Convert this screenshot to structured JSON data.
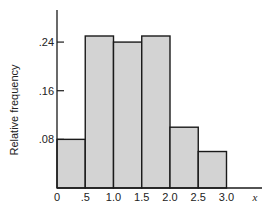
{
  "chart_data": {
    "type": "bar",
    "subtype": "histogram",
    "title": "",
    "xlabel": "x",
    "ylabel": "Relative frequency",
    "bins": [
      [
        0.0,
        0.5
      ],
      [
        0.5,
        1.0
      ],
      [
        1.0,
        1.5
      ],
      [
        1.5,
        2.0
      ],
      [
        2.0,
        2.5
      ],
      [
        2.5,
        3.0
      ]
    ],
    "categories": [
      "0-0.5",
      "0.5-1.0",
      "1.0-1.5",
      "1.5-2.0",
      "2.0-2.5",
      "2.5-3.0"
    ],
    "values": [
      0.08,
      0.25,
      0.24,
      0.25,
      0.1,
      0.06
    ],
    "xticks": [
      0,
      0.5,
      1.0,
      1.5,
      2.0,
      2.5,
      3.0
    ],
    "xtick_labels": [
      "0",
      ".5",
      "1.0",
      "1.5",
      "2.0",
      "2.5",
      "3.0"
    ],
    "yticks": [
      0.08,
      0.16,
      0.24
    ],
    "ytick_labels": [
      ".08",
      ".16",
      ".24"
    ],
    "xlim": [
      0,
      3.6
    ],
    "ylim": [
      0,
      0.29
    ],
    "grid": false,
    "legend": null,
    "bar_fill": "#d3d3d3",
    "bar_edge": "#1a1a1a"
  }
}
